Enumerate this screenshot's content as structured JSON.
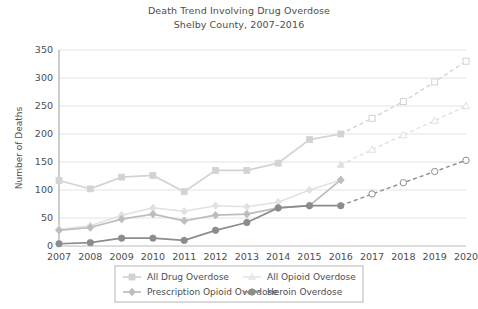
{
  "chart_data": {
    "type": "line",
    "title": "Death Trend Involving Drug Overdose",
    "subtitle": "Shelby County, 2007–2016",
    "xlabel": "",
    "ylabel": "Number of Deaths",
    "ylim": [
      0,
      350
    ],
    "ytick_labels": [
      "0",
      "50",
      "100",
      "150",
      "200",
      "250",
      "300",
      "350"
    ],
    "ytick_values": [
      0,
      50,
      100,
      150,
      200,
      250,
      300,
      350
    ],
    "grid": "horizontal",
    "legend_position": "bottom",
    "categories": [
      "2007",
      "2008",
      "2009",
      "2010",
      "2011",
      "2012",
      "2013",
      "2014",
      "2015",
      "2016",
      "2017",
      "2018",
      "2019",
      "2020"
    ],
    "x": [
      2007,
      2008,
      2009,
      2010,
      2011,
      2012,
      2013,
      2014,
      2015,
      2016,
      2017,
      2018,
      2019,
      2020
    ],
    "observed_through": 2016,
    "projected_from": 2016,
    "series": [
      {
        "name": "All Drug Overdose",
        "color": "#d3d3d3",
        "marker": "square",
        "values": [
          117,
          102,
          123,
          126,
          97,
          135,
          135,
          148,
          190,
          200,
          228,
          258,
          293,
          330
        ]
      },
      {
        "name": "All Opioid Overdose",
        "color": "#e0e0e0",
        "marker": "triangle",
        "values": [
          null,
          null,
          null,
          null,
          null,
          null,
          null,
          null,
          null,
          145,
          172,
          198,
          224,
          250
        ]
      },
      {
        "name": "Prescription Opioid Overdose",
        "color": "#bdbdbd",
        "marker": "diamond",
        "values": [
          28,
          33,
          48,
          57,
          45,
          55,
          57,
          68,
          72,
          118,
          null,
          null,
          null,
          null
        ]
      },
      {
        "name": "Heroin Overdose",
        "color": "#8c8c8c",
        "marker": "circle",
        "values": [
          4,
          6,
          14,
          14,
          10,
          28,
          42,
          68,
          72,
          72,
          93,
          113,
          133,
          153
        ]
      }
    ],
    "extra_series_note": {
      "all_opioid_observed": [
        null,
        null,
        null,
        null,
        null,
        null,
        null,
        null,
        null,
        145
      ],
      "prescription_light_overlay": [
        30,
        36,
        55,
        68,
        62,
        72,
        70,
        78,
        100,
        118
      ]
    }
  },
  "legend": {
    "items": [
      {
        "label": "All Drug Overdose",
        "color": "#d3d3d3",
        "marker": "square"
      },
      {
        "label": "All Opioid Overdose",
        "color": "#e8e8e8",
        "marker": "triangle"
      },
      {
        "label": "Prescription Opioid Overdose",
        "color": "#bdbdbd",
        "marker": "diamond"
      },
      {
        "label": "Heroin Overdose",
        "color": "#8c8c8c",
        "marker": "circle"
      }
    ]
  }
}
